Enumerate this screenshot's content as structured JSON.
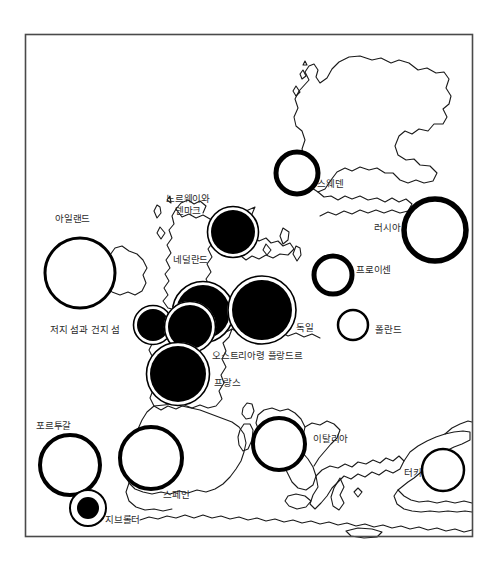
{
  "figure": {
    "type": "proportional-symbol-map",
    "region": "Europe",
    "frame": {
      "x": 25,
      "y": 34,
      "width": 448,
      "height": 503,
      "stroke": "#4a4a4a"
    },
    "background": "#ffffff",
    "ink": "#000000",
    "label_color": "#2b2b2b"
  },
  "symbols": [
    {
      "id": "ireland",
      "label": "아일랜드",
      "cx": 80,
      "cy": 273,
      "r": 35,
      "style": "thin-outline",
      "ring": 3.0,
      "fill": "none"
    },
    {
      "id": "norway-denmark",
      "label": "노르웨이와\n덴마크",
      "cx": 233,
      "cy": 232,
      "r": 22,
      "style": "filled-halo",
      "ring": 2.5,
      "fill": "black"
    },
    {
      "id": "netherlands",
      "label": "네덜란드",
      "cx": 203,
      "cy": 312,
      "r": 27,
      "style": "filled-halo",
      "ring": 2.5,
      "fill": "black"
    },
    {
      "id": "jersey-guernsey",
      "label": "저지 섬과 건지 섬",
      "cx": 153,
      "cy": 325,
      "r": 16,
      "style": "filled-halo",
      "ring": 2.5,
      "fill": "black"
    },
    {
      "id": "austrian-flanders",
      "label": "오스트리아령 플랑드르",
      "cx": 190,
      "cy": 327,
      "r": 22,
      "style": "filled-halo",
      "ring": 2.5,
      "fill": "black"
    },
    {
      "id": "germany",
      "label": "독일",
      "cx": 262,
      "cy": 310,
      "r": 30,
      "style": "filled-halo",
      "ring": 3.0,
      "fill": "black"
    },
    {
      "id": "france",
      "label": "프랑스",
      "cx": 178,
      "cy": 374,
      "r": 28,
      "style": "filled-halo",
      "ring": 2.5,
      "fill": "black"
    },
    {
      "id": "sweden",
      "label": "스웨덴",
      "cx": 297,
      "cy": 173,
      "r": 21,
      "style": "thick-ring",
      "ring": 5.0,
      "fill": "none"
    },
    {
      "id": "russia",
      "label": "러시아",
      "cx": 435,
      "cy": 230,
      "r": 31,
      "style": "thick-ring",
      "ring": 5.5,
      "fill": "none"
    },
    {
      "id": "prussia",
      "label": "프로이센",
      "cx": 333,
      "cy": 275,
      "r": 19,
      "style": "thick-ring",
      "ring": 5.0,
      "fill": "none"
    },
    {
      "id": "poland",
      "label": "폴란드",
      "cx": 353,
      "cy": 325,
      "r": 15,
      "style": "thin-outline",
      "ring": 2.5,
      "fill": "none"
    },
    {
      "id": "italy",
      "label": "이탈리아",
      "cx": 279,
      "cy": 444,
      "r": 26,
      "style": "thick-ring",
      "ring": 4.0,
      "fill": "none"
    },
    {
      "id": "turkey",
      "label": "터키",
      "cx": 443,
      "cy": 470,
      "r": 21,
      "style": "thin-outline",
      "ring": 2.5,
      "fill": "none"
    },
    {
      "id": "portugal",
      "label": "포르투갈",
      "cx": 70,
      "cy": 465,
      "r": 30,
      "style": "thick-ring",
      "ring": 4.0,
      "fill": "none"
    },
    {
      "id": "spain",
      "label": "스페인",
      "cx": 151,
      "cy": 458,
      "r": 31,
      "style": "thick-ring",
      "ring": 4.0,
      "fill": "none"
    },
    {
      "id": "gibraltar",
      "label": "지브롤터",
      "cx": 88,
      "cy": 508,
      "r": 18,
      "style": "filled-core",
      "ring": 2.0,
      "fill": "black",
      "core_r": 11
    }
  ],
  "labels": [
    {
      "id": "label-ireland",
      "text": "아일랜드",
      "x": 55,
      "y": 213,
      "align": "left"
    },
    {
      "id": "label-norway-denmark",
      "text": "노르웨이와\n덴마크",
      "x": 166,
      "y": 193,
      "align": "left"
    },
    {
      "id": "label-netherlands",
      "text": "네덜란드",
      "x": 173,
      "y": 254,
      "align": "left"
    },
    {
      "id": "label-jersey-guernsey",
      "text": "저지 섬과 건지 섬",
      "x": 50,
      "y": 324,
      "align": "left"
    },
    {
      "id": "label-austrian-flanders",
      "text": "오스트리아령 플랑드르",
      "x": 212,
      "y": 350,
      "align": "left"
    },
    {
      "id": "label-france",
      "text": "프랑스",
      "x": 214,
      "y": 377,
      "align": "left"
    },
    {
      "id": "label-germany",
      "text": "독일",
      "x": 296,
      "y": 322,
      "align": "left"
    },
    {
      "id": "label-sweden",
      "text": "스웨덴",
      "x": 317,
      "y": 178,
      "align": "left"
    },
    {
      "id": "label-russia",
      "text": "러시아",
      "x": 374,
      "y": 222,
      "align": "left"
    },
    {
      "id": "label-prussia",
      "text": "프로이센",
      "x": 356,
      "y": 264,
      "align": "left"
    },
    {
      "id": "label-poland",
      "text": "폴란드",
      "x": 375,
      "y": 324,
      "align": "left"
    },
    {
      "id": "label-italy",
      "text": "이탈리아",
      "x": 313,
      "y": 433,
      "align": "left"
    },
    {
      "id": "label-turkey",
      "text": "터키",
      "x": 404,
      "y": 467,
      "align": "left"
    },
    {
      "id": "label-portugal",
      "text": "포르투갈",
      "x": 36,
      "y": 420,
      "align": "left"
    },
    {
      "id": "label-spain",
      "text": "스페인",
      "x": 163,
      "y": 489,
      "align": "left"
    },
    {
      "id": "label-gibraltar",
      "text": "지브롤터",
      "x": 105,
      "y": 514,
      "align": "left"
    }
  ]
}
